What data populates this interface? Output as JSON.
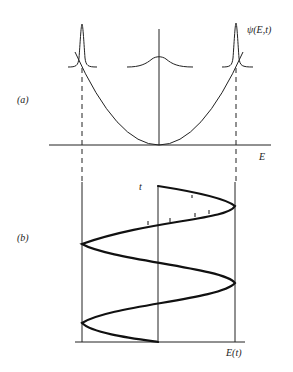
{
  "figure": {
    "panels": [
      {
        "id": "a",
        "label": "(a)",
        "x_axis_label": "E",
        "wavefunction_label": "ψ(E,t)",
        "description": "Parabolic potential with wave packets at left turning point, center, and right turning point"
      },
      {
        "id": "b",
        "label": "(b)",
        "x_axis_label": "E(t)",
        "y_axis_label": "t",
        "description": "Oscillatory trajectory E(t) bouncing between classical turning points over time"
      }
    ],
    "colors": {
      "line": "#222222",
      "background": "#ffffff"
    }
  }
}
